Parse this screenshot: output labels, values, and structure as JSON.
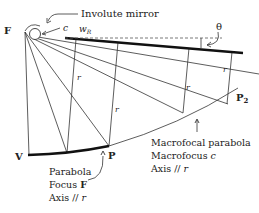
{
  "diagram": {
    "labels": {
      "focus": "F",
      "involute_mirror": "Involute mirror",
      "c": "c",
      "w_R": "w",
      "w_R_sub": "R",
      "theta": "θ",
      "r": "r",
      "P2": "P",
      "P2_sub": "2",
      "V": "V",
      "P": "P"
    },
    "annotations": {
      "parabola": {
        "line1": "Parabola",
        "line2_prefix": "Focus ",
        "line2_bold": "F",
        "line3_prefix": "Axis // ",
        "line3_italic": "r"
      },
      "macrofocal": {
        "line1": "Macrofocal parabola",
        "line2_prefix": "Macrofocus ",
        "line2_italic": "c",
        "line3_prefix": "Axis // ",
        "line3_italic": "r"
      }
    },
    "colors": {
      "ink": "#222222",
      "dashed": "#555555"
    }
  }
}
